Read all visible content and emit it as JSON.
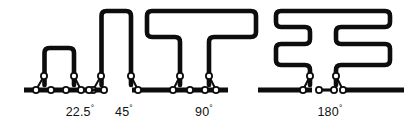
{
  "figure": {
    "name": "folded-chain-angle-series",
    "background_color": "#ffffff",
    "ink_color": "#0d0d0d",
    "width": 417,
    "height": 129,
    "baseline_y": 90,
    "labels": [
      {
        "id": "label-22-5",
        "value": "22.5",
        "degree_symbol": "°",
        "x": 80,
        "y": 116
      },
      {
        "id": "label-45",
        "value": "45",
        "degree_symbol": "°",
        "x": 124,
        "y": 116
      },
      {
        "id": "label-90",
        "value": "90",
        "degree_symbol": "°",
        "x": 204,
        "y": 116
      },
      {
        "id": "label-180",
        "value": "180",
        "degree_symbol": "°",
        "x": 330,
        "y": 116
      }
    ],
    "folded_shapes": [
      {
        "id": "shape-22-5",
        "label": "22.5",
        "description": "single narrow arch",
        "path": "M 44.5 85 L 44.5 53 Q 44.5 48 49.5 48 L 69 48 Q 74 48 74 53 L 74 85"
      },
      {
        "id": "shape-45",
        "label": "45",
        "description": "single tall arch",
        "path": "M 101.5 85 L 101.5 16 Q 101.5 11 106.5 11 L 126 11 Q 131 11 131 16 L 131 85"
      },
      {
        "id": "shape-90",
        "label": "90",
        "description": "T shaped double fold",
        "path": "M 180 85 L 180 42 Q 180 37 175 37 L 152 37 Q 147 37 147 32 L 147 16 Q 147 11 152 11 L 251 11 Q 256 11 256 16 L 256 32 Q 256 37 251 37 L 214 37 Q 209 37 209 42 L 209 85"
      },
      {
        "id": "shape-180",
        "label": "180",
        "description": "mirrored double comb fold",
        "path": "M 310 85 L 310 70 Q 310 65 305 65 L 281 65 Q 276 65 276 60 L 276 49 Q 276 44 281 44 L 305 44 Q 310 44 310 39 L 310 32 Q 310 27 305 27 L 281 27 Q 276 27 276 22 L 276 16 Q 276 11 281 11 L 385 11 Q 390 11 390 16 L 390 22 Q 390 27 385 27 L 341 27 Q 336 27 336 32 L 336 39 Q 336 44 341 44 L 385 44 Q 390 44 390 49 L 390 60 Q 390 65 385 65 L 341 65 Q 336 65 336 70 L 336 85"
      }
    ],
    "baseline_segments": [
      {
        "id": "baseline-seg-1",
        "x1": 24,
        "x2": 101
      },
      {
        "id": "baseline-seg-2",
        "x1": 132,
        "x2": 228
      },
      {
        "id": "baseline-seg-3",
        "x1": 258,
        "x2": 312
      },
      {
        "id": "baseline-seg-4",
        "x1": 344,
        "x2": 404
      }
    ],
    "joint_clusters": [
      {
        "id": "joint-cluster-1",
        "base_ring_x": 36,
        "arm_ring_x": 44,
        "arm_ring_y": 76,
        "apex_x": 44
      },
      {
        "id": "joint-cluster-2",
        "base_ring_x": 81,
        "arm_ring_x": 74,
        "arm_ring_y": 76,
        "apex_x": 74
      },
      {
        "id": "joint-cluster-3",
        "base_ring_x": 93,
        "arm_ring_x": 101,
        "arm_ring_y": 76,
        "apex_x": 101
      },
      {
        "id": "joint-cluster-4",
        "base_ring_x": 138,
        "arm_ring_x": 131,
        "arm_ring_y": 76,
        "apex_x": 131
      },
      {
        "id": "joint-cluster-5",
        "base_ring_x": 173,
        "arm_ring_x": 180,
        "arm_ring_y": 76,
        "apex_x": 180
      },
      {
        "id": "joint-cluster-6",
        "base_ring_x": 216,
        "arm_ring_x": 209,
        "arm_ring_y": 76,
        "apex_x": 209
      },
      {
        "id": "joint-cluster-7",
        "base_ring_x": 303,
        "arm_ring_x": 310,
        "arm_ring_y": 76,
        "apex_x": 310
      },
      {
        "id": "joint-cluster-8",
        "base_ring_x": 343,
        "arm_ring_x": 336,
        "arm_ring_y": 76,
        "apex_x": 336
      }
    ],
    "dumbbells": [
      {
        "id": "dumbbell-1",
        "left_ring_x": 51,
        "right_ring_x": 66
      },
      {
        "id": "dumbbell-2",
        "left_ring_x": 89,
        "right_ring_x": 104
      },
      {
        "id": "dumbbell-3",
        "left_ring_x": 190,
        "right_ring_x": 205
      },
      {
        "id": "dumbbell-4",
        "left_ring_x": 319,
        "right_ring_x": 334
      }
    ]
  }
}
